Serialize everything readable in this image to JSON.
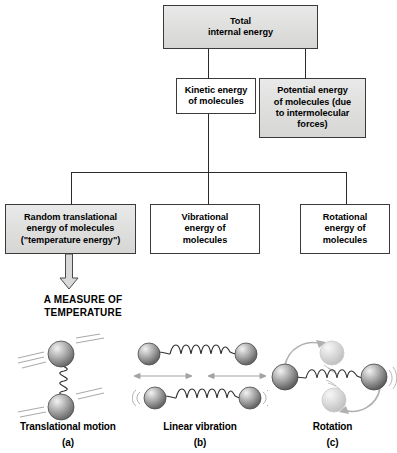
{
  "diagram": {
    "colors": {
      "box_fill_gray": "#e2e2e1",
      "box_fill_white": "#ffffff",
      "box_border": "#3a3a3a",
      "connector": "#2b2b2b",
      "arrow_fill": "#d9d9d9",
      "sphere_light": "#f0f0f0",
      "sphere_mid": "#9a9a9a",
      "sphere_dark": "#5c5c5c",
      "background": "#ffffff"
    },
    "boxes": {
      "total": "Total\ninternal energy",
      "kinetic": "Kinetic energy\nof molecules",
      "potential": "Potential energy\nof molecules (due\nto intermolecular\nforces)",
      "random": "Random translational\nenergy of molecules\n(\"temperature energy\")",
      "vibrational": "Vibrational\nenergy of\nmolecules",
      "rotational": "Rotational\nenergy of\nmolecules"
    },
    "measure_label": "A MEASURE OF\nTEMPERATURE",
    "illustrations": [
      {
        "title": "Translational motion",
        "letter": "(a)",
        "icon": "two-spheres-spring-vertical"
      },
      {
        "title": "Linear vibration",
        "letter": "(b)",
        "icon": "two-spheres-spring-horizontal"
      },
      {
        "title": "Rotation",
        "letter": "(c)",
        "icon": "two-spheres-spring-rotating"
      }
    ]
  }
}
